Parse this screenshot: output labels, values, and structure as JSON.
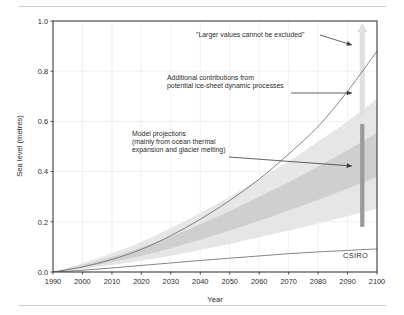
{
  "figure": {
    "credit": "CSIRO",
    "background": "#ffffff"
  },
  "chart_data": {
    "type": "area",
    "title": "",
    "subtitle": "",
    "xlabel": "Year",
    "ylabel": "Sea level (metres)",
    "xlim": [
      1990,
      2100
    ],
    "ylim": [
      0.0,
      1.0
    ],
    "grid": true,
    "legend": "none",
    "x_ticks": [
      1990,
      2000,
      2010,
      2020,
      2030,
      2040,
      2050,
      2060,
      2070,
      2080,
      2090,
      2100
    ],
    "x_tick_labels": [
      "1990",
      "2000",
      "2010",
      "2020",
      "2030",
      "2040",
      "2050",
      "2060",
      "2070",
      "2080",
      "2090",
      "2100"
    ],
    "y_ticks": [
      0.0,
      0.2,
      0.4,
      0.6,
      0.8,
      1.0
    ],
    "y_tick_labels": [
      "0.0",
      "0.2",
      "0.4",
      "0.6",
      "0.8",
      "1.0"
    ],
    "x": [
      1990,
      2000,
      2010,
      2020,
      2030,
      2040,
      2050,
      2060,
      2070,
      2080,
      2090,
      2100
    ],
    "series": [
      {
        "name": "Model projections upper bound (light grey band top)",
        "role": "band-outer-upper",
        "color": "#e4e4e4",
        "values": [
          0.0,
          0.035,
          0.075,
          0.12,
          0.175,
          0.235,
          0.3,
          0.37,
          0.44,
          0.52,
          0.6,
          0.69
        ]
      },
      {
        "name": "Model projections lower bound (light grey band bottom)",
        "role": "band-outer-lower",
        "color": "#e4e4e4",
        "values": [
          0.0,
          0.012,
          0.028,
          0.045,
          0.065,
          0.088,
          0.112,
          0.138,
          0.165,
          0.193,
          0.222,
          0.252
        ]
      },
      {
        "name": "Model projections central range upper (mid grey band top)",
        "role": "band-inner-upper",
        "color": "#cdcdcd",
        "values": [
          0.0,
          0.028,
          0.06,
          0.098,
          0.142,
          0.19,
          0.243,
          0.3,
          0.358,
          0.42,
          0.485,
          0.555
        ]
      },
      {
        "name": "Model projections central range lower (mid grey band bottom)",
        "role": "band-inner-lower",
        "color": "#cdcdcd",
        "values": [
          0.0,
          0.018,
          0.04,
          0.065,
          0.095,
          0.128,
          0.165,
          0.204,
          0.245,
          0.288,
          0.332,
          0.378
        ]
      },
      {
        "name": "Additional ice-sheet dynamic contribution upper curve",
        "role": "line-upper",
        "color": "#6b6b6b",
        "values": [
          0.0,
          0.02,
          0.05,
          0.09,
          0.145,
          0.21,
          0.285,
          0.37,
          0.47,
          0.58,
          0.72,
          0.88
        ]
      },
      {
        "name": "Lower bound curve",
        "role": "line-lower",
        "color": "#6b6b6b",
        "values": [
          0.0,
          0.007,
          0.016,
          0.026,
          0.036,
          0.046,
          0.055,
          0.064,
          0.073,
          0.08,
          0.086,
          0.092
        ]
      }
    ],
    "markers": [
      {
        "name": "projection-range-bar",
        "type": "vertical-bar",
        "x": 2095,
        "y_low": 0.18,
        "y_high": 0.59,
        "color": "#9a9a9a"
      },
      {
        "name": "larger-values-arrow",
        "type": "up-arrow",
        "x": 2095,
        "y_low": 0.62,
        "y_high": 1.0,
        "color": "#e0e0e0"
      }
    ],
    "annotations": [
      {
        "id": "larger-values",
        "lines": [
          "\"Larger values cannot be excluded\""
        ],
        "target_x": 2095,
        "target_y": 0.9
      },
      {
        "id": "ice-sheet",
        "lines": [
          "Additional contributions from",
          "potential ice-sheet dynamic processes"
        ],
        "target_x": 2095,
        "target_y": 0.715
      },
      {
        "id": "model-projections",
        "lines": [
          "Model projections",
          "(mainly from ocean thermal",
          "expansion and glacier melting)"
        ],
        "target_x": 2095,
        "target_y": 0.48
      }
    ]
  }
}
